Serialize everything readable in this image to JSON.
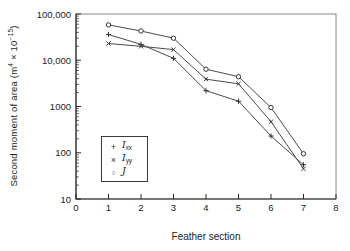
{
  "chart_data": {
    "type": "line",
    "title": "",
    "xlabel": "Feather section",
    "ylabel_parts": {
      "text1": "Second moment of area (m",
      "exp1": "4",
      "text2": " × 10",
      "exp2": "−15",
      "text3": ")"
    },
    "x_ticks": [
      0,
      1,
      2,
      3,
      4,
      5,
      6,
      7,
      8
    ],
    "xlim": [
      0,
      8
    ],
    "y_scale": "log",
    "ylim": [
      10,
      100000
    ],
    "y_tick_values": [
      10,
      100,
      1000,
      10000,
      100000
    ],
    "y_tick_labels": [
      "10",
      "100",
      "1000",
      "10,000",
      "100,000"
    ],
    "grid": false,
    "legend_position": "lower-left-inside",
    "line_color": "#4a4a4a",
    "marker_color": "#333333",
    "categories": [
      1,
      2,
      3,
      4,
      5,
      6,
      7
    ],
    "series": [
      {
        "name": "Ixx",
        "marker": "plus",
        "marker_glyph": "+",
        "legend_main": "I",
        "legend_sub": "xx",
        "values": [
          36000,
          22000,
          11000,
          2200,
          1300,
          230,
          55
        ]
      },
      {
        "name": "Iyy",
        "marker": "cross",
        "marker_glyph": "×",
        "legend_main": "I",
        "legend_sub": "yy",
        "values": [
          23000,
          20000,
          17000,
          3900,
          3100,
          470,
          45
        ]
      },
      {
        "name": "J",
        "marker": "circle",
        "marker_glyph": "○",
        "legend_main": "J",
        "legend_sub": "",
        "values": [
          58000,
          43000,
          30000,
          6400,
          4400,
          950,
          95
        ]
      }
    ]
  }
}
